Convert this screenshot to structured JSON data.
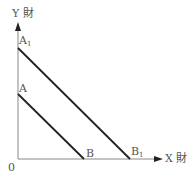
{
  "diagram": {
    "type": "budget-line-shift",
    "axes": {
      "y_label": "Y 財",
      "x_label": "X 財",
      "origin_label": "0"
    },
    "points": {
      "A1": {
        "label": "A",
        "sub": "1"
      },
      "A": {
        "label": "A",
        "sub": ""
      },
      "B": {
        "label": "B",
        "sub": ""
      },
      "B1": {
        "label": "B",
        "sub": "1"
      }
    },
    "lines": [
      {
        "name": "AB",
        "from": "A",
        "to": "B"
      },
      {
        "name": "A1B1",
        "from": "A1",
        "to": "B1"
      }
    ],
    "colors": {
      "axis": "#777777",
      "line": "#222222",
      "text": "#555555"
    }
  }
}
